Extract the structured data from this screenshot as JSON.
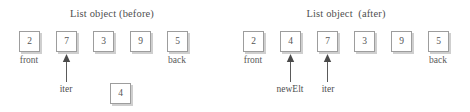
{
  "figure": {
    "background_color": "#ffffff",
    "box_border_color": "#9d9d9d",
    "box_shadow_color": "#cfcfcf",
    "arrow_color": "#5a5a5a",
    "text_color": "#4f4f4f"
  },
  "panels": [
    {
      "id": "before",
      "title": "List object (before)",
      "cells": [
        {
          "value": "2",
          "x": 19,
          "y": 31
        },
        {
          "value": "7",
          "x": 56,
          "y": 31
        },
        {
          "value": "3",
          "x": 93,
          "y": 31
        },
        {
          "value": "9",
          "x": 130,
          "y": 31
        },
        {
          "value": "5",
          "x": 167,
          "y": 31
        }
      ],
      "endpoint_labels": [
        {
          "text": "front",
          "x": 16,
          "y": 55
        },
        {
          "text": "back",
          "x": 164,
          "y": 55
        }
      ],
      "pointers": [
        {
          "label": "newElt",
          "visible": false
        },
        {
          "label": "iter",
          "x": 57,
          "y": 84,
          "arrow_x": 66,
          "arrow_top": 55,
          "arrow_bottom": 81
        }
      ],
      "floating_cells": [
        {
          "value": "4",
          "x": 110,
          "y": 83
        }
      ]
    },
    {
      "id": "after",
      "title": "List object  (after)",
      "cells": [
        {
          "value": "2",
          "x": 243,
          "y": 31
        },
        {
          "value": "4",
          "x": 280,
          "y": 31
        },
        {
          "value": "7",
          "x": 317,
          "y": 31
        },
        {
          "value": "3",
          "x": 354,
          "y": 31
        },
        {
          "value": "9",
          "x": 391,
          "y": 31
        },
        {
          "value": "5",
          "x": 428,
          "y": 31
        }
      ],
      "endpoint_labels": [
        {
          "text": "front",
          "x": 240,
          "y": 55
        },
        {
          "text": "back",
          "x": 425,
          "y": 55
        }
      ],
      "pointers": [
        {
          "label": "newElt",
          "x": 266,
          "y": 84,
          "arrow_x": 290,
          "arrow_top": 55,
          "arrow_bottom": 81
        },
        {
          "label": "iter",
          "x": 317,
          "y": 84,
          "arrow_x": 327,
          "arrow_top": 55,
          "arrow_bottom": 81
        }
      ],
      "floating_cells": []
    }
  ],
  "titles": {
    "before": "List object (before)",
    "after": "List object  (after)"
  },
  "left": {
    "cell_values": [
      "2",
      "7",
      "3",
      "9",
      "5"
    ],
    "front_label": "front",
    "back_label": "back",
    "iter_label": "iter",
    "new_element_value": "4"
  },
  "right": {
    "cell_values": [
      "2",
      "4",
      "7",
      "3",
      "9",
      "5"
    ],
    "front_label": "front",
    "back_label": "back",
    "new_elt_label": "newElt",
    "iter_label": "iter"
  }
}
